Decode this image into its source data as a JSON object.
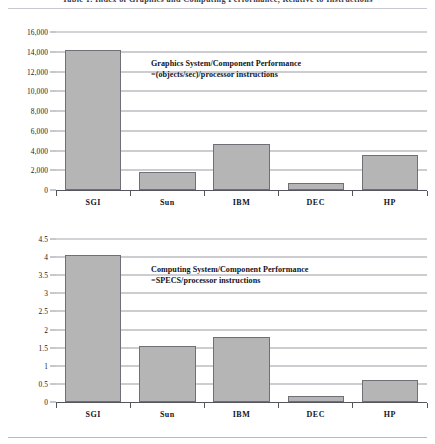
{
  "running_head": "Table 1. Index of Graphics and Computing Performance, Relative to Instructions",
  "figures": [
    {
      "id": "graphics",
      "annotation_line1": "Graphics System/Component Performance",
      "annotation_line2": "=(objects/sec)/processor instructions"
    },
    {
      "id": "computing",
      "annotation_line1": "Computing System/Component Performance",
      "annotation_line2": "=SPECS/processor instructions"
    }
  ],
  "chart_data": [
    {
      "type": "bar",
      "id": "graphics",
      "title": "Graphics System/Component Performance =(objects/sec)/processor instructions",
      "categories": [
        "SGI",
        "Sun",
        "IBM",
        "DEC",
        "HP"
      ],
      "values": [
        14200,
        1850,
        4700,
        700,
        3500
      ],
      "xlabel": "",
      "ylabel": "",
      "ylim": [
        0,
        16000
      ],
      "yticks": [
        0,
        2000,
        4000,
        6000,
        8000,
        10000,
        12000,
        14000,
        16000
      ],
      "ytick_labels": [
        "0",
        "2,000",
        "4,000",
        "6,000",
        "8,000",
        "10,000",
        "12,000",
        "14,000",
        "16,000"
      ],
      "grid": true,
      "legend": "none",
      "bar_color": "#b5b5b5",
      "bar_edge_color": "#6f6f76"
    },
    {
      "type": "bar",
      "id": "computing",
      "title": "Computing System/Component Performance =SPECS/processor instructions",
      "categories": [
        "SGI",
        "Sun",
        "IBM",
        "DEC",
        "HP"
      ],
      "values": [
        4.05,
        1.55,
        1.8,
        0.17,
        0.6
      ],
      "xlabel": "",
      "ylabel": "",
      "ylim": [
        0,
        4.5
      ],
      "yticks": [
        0,
        0.5,
        1,
        1.5,
        2,
        2.5,
        3,
        3.5,
        4,
        4.5
      ],
      "ytick_labels": [
        "0",
        "0.5",
        "1",
        "1.5",
        "2",
        "2.5",
        "3",
        "3.5",
        "4",
        "4.5"
      ],
      "grid": true,
      "legend": "none",
      "bar_color": "#b5b5b5",
      "bar_edge_color": "#6f6f76"
    }
  ]
}
